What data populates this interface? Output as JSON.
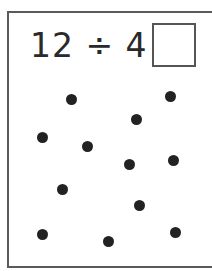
{
  "equation": {
    "text": "12 ÷ 4 =",
    "dividend": 12,
    "divisor": 4,
    "answer": ""
  },
  "dots": [
    {
      "x": 71,
      "y": 99
    },
    {
      "x": 170,
      "y": 96
    },
    {
      "x": 136,
      "y": 119
    },
    {
      "x": 42,
      "y": 137
    },
    {
      "x": 87,
      "y": 146
    },
    {
      "x": 129,
      "y": 164
    },
    {
      "x": 173,
      "y": 160
    },
    {
      "x": 62,
      "y": 189
    },
    {
      "x": 139,
      "y": 205
    },
    {
      "x": 42,
      "y": 234
    },
    {
      "x": 108,
      "y": 241
    },
    {
      "x": 175,
      "y": 232
    }
  ],
  "dot_count": 12,
  "colors": {
    "ink": "#222222",
    "border": "#5a5a5a"
  }
}
